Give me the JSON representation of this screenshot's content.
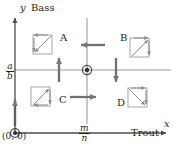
{
  "figure": {
    "type": "phase-plane-diagram",
    "width": 175,
    "height": 148,
    "background": "#ffffff",
    "ink_color": "#231f20",
    "nullcline_color": "#8f9194",
    "axis_color": "#5a5c5e"
  },
  "axes": {
    "y_axis": {
      "symbol": "y",
      "name": "Bass"
    },
    "x_axis": {
      "symbol": "x",
      "name": "Trout"
    },
    "origin_label": "(0, 0)"
  },
  "ticks": {
    "y_nullcline": {
      "numerator": "a",
      "denominator": "b"
    },
    "x_nullcline": {
      "numerator": "m",
      "denominator": "n"
    }
  },
  "regions": [
    {
      "label": "A",
      "quadrant": "upper-left",
      "flow": "left-and-up",
      "spiral": "counterclockwise"
    },
    {
      "label": "B",
      "quadrant": "upper-right",
      "flow": "left-and-down",
      "spiral": "clockwise-inward"
    },
    {
      "label": "C",
      "quadrant": "lower-left",
      "flow": "right-and-up",
      "spiral": "counterclockwise"
    },
    {
      "label": "D",
      "quadrant": "lower-right",
      "flow": "right-and-down",
      "spiral": "clockwise"
    }
  ],
  "equilibria": [
    {
      "name": "origin-equilibrium",
      "label": "(0, 0)",
      "marker": "circled-dot"
    },
    {
      "name": "interior-equilibrium",
      "label": "(m/n, a/b)",
      "marker": "circled-dot"
    }
  ],
  "direction_arrows": [
    {
      "name": "arrow-region-a-left",
      "direction": "left"
    },
    {
      "name": "arrow-region-b-down",
      "direction": "down"
    },
    {
      "name": "arrow-region-c-up",
      "direction": "up"
    },
    {
      "name": "arrow-region-d-right",
      "direction": "right"
    },
    {
      "name": "arrow-y-axis-up",
      "direction": "up"
    }
  ]
}
